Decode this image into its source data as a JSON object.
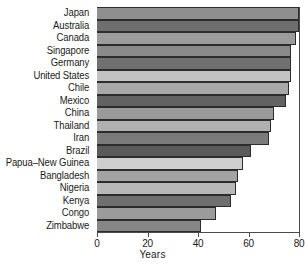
{
  "chart_data": {
    "type": "bar",
    "orientation": "horizontal",
    "title": "",
    "xlabel": "Years",
    "ylabel": "",
    "xlim": [
      0,
      80
    ],
    "xticks": [
      0,
      20,
      40,
      60,
      80
    ],
    "xticklabels": [
      "0",
      "20",
      "40",
      "60",
      "80"
    ],
    "grid": false,
    "legend": false,
    "categories": [
      "Japan",
      "Australia",
      "Canada",
      "Singapore",
      "Germany",
      "United States",
      "Chile",
      "Mexico",
      "China",
      "Thailand",
      "Iran",
      "Brazil",
      "Papua–New Guinea",
      "Bangladesh",
      "Nigeria",
      "Kenya",
      "Congo",
      "Zimbabwe"
    ],
    "values": [
      80,
      80,
      79,
      77,
      77,
      77,
      76,
      75,
      70,
      69,
      68,
      61,
      58,
      56,
      55,
      53,
      47,
      41
    ],
    "bar_colors": [
      "#8f8f8f",
      "#6e6e6e",
      "#9c9c9c",
      "#8a8a8a",
      "#707070",
      "#c3c3c3",
      "#a8a8a8",
      "#626262",
      "#9a9a9a",
      "#b0b0b0",
      "#7b7b7b",
      "#5a5a5a",
      "#cfcfcf",
      "#a3a3a3",
      "#b8b8b8",
      "#6f6f6f",
      "#9b9b9b",
      "#868686"
    ],
    "bar_edge_color": "#2c2c2c",
    "axis_color": "#4a4a4a",
    "background_color": "#ffffff",
    "text_color": "#1a1a1a"
  }
}
